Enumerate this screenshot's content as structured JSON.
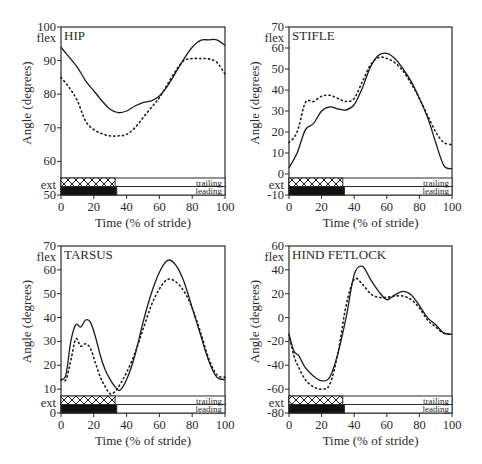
{
  "figure": {
    "xlabel": "Time (% of stride)",
    "ylabel": "Angle (degrees)",
    "flex_label": "flex",
    "ext_label": "ext",
    "bar_labels": {
      "trailing": "trailing",
      "leading": "leading"
    },
    "colors": {
      "line": "#1a1a1a",
      "frame": "#2a2a2a",
      "background": "#ffffff"
    }
  },
  "chart_data": [
    {
      "type": "line",
      "title": "HIP",
      "xlabel": "Time (% of stride)",
      "ylabel": "Angle (degrees)",
      "xlim": [
        0,
        100
      ],
      "ylim": [
        50,
        100
      ],
      "xticks": [
        0,
        20,
        40,
        60,
        80,
        100
      ],
      "yticks": [
        50,
        60,
        70,
        80,
        90,
        100
      ],
      "ytick_labels": [
        "50",
        "60",
        "70",
        "80",
        "90",
        "100"
      ],
      "x": [
        0,
        5,
        10,
        15,
        20,
        25,
        30,
        35,
        40,
        45,
        50,
        55,
        60,
        65,
        70,
        75,
        80,
        85,
        90,
        95,
        100
      ],
      "series": [
        {
          "name": "leading (solid)",
          "style": "solid",
          "values": [
            94,
            91,
            88,
            84,
            81,
            78,
            75.5,
            74.5,
            75,
            76.5,
            77.5,
            78,
            79.5,
            82.5,
            86.5,
            90.5,
            94,
            96,
            96.2,
            96.2,
            94.5
          ]
        },
        {
          "name": "trailing (dotted)",
          "style": "dotted",
          "values": [
            85,
            82,
            78,
            72,
            69.5,
            68.2,
            67.6,
            67.6,
            68,
            70,
            73,
            76,
            79,
            83,
            87,
            90,
            90.6,
            90.6,
            90.5,
            89.5,
            86
          ]
        }
      ],
      "stance_bars": {
        "trailing_end": 33,
        "leading_end": 34
      }
    },
    {
      "type": "line",
      "title": "STIFLE",
      "xlabel": "Time (% of stride)",
      "ylabel": "Angle (degrees)",
      "xlim": [
        0,
        100
      ],
      "ylim": [
        -10,
        70
      ],
      "xticks": [
        0,
        20,
        40,
        60,
        80,
        100
      ],
      "yticks": [
        -10,
        0,
        10,
        20,
        30,
        40,
        50,
        60,
        70
      ],
      "ytick_labels": [
        "-10",
        "0",
        "10",
        "20",
        "30",
        "40",
        "50",
        "60",
        "70"
      ],
      "x": [
        0,
        5,
        10,
        15,
        20,
        25,
        30,
        35,
        40,
        45,
        50,
        55,
        60,
        65,
        70,
        75,
        80,
        85,
        90,
        95,
        100
      ],
      "series": [
        {
          "name": "leading (solid)",
          "style": "solid",
          "values": [
            3,
            10,
            21,
            24,
            30,
            32,
            31,
            30.5,
            33,
            41,
            51,
            56.5,
            57.5,
            55,
            50,
            44,
            36,
            27,
            15,
            4,
            2.5
          ]
        },
        {
          "name": "trailing (dotted)",
          "style": "dotted",
          "values": [
            15,
            20,
            34,
            34.5,
            37,
            37.5,
            36,
            34.5,
            36,
            44,
            52,
            55.5,
            55,
            53,
            49,
            43,
            36,
            28,
            20,
            15,
            14
          ]
        }
      ],
      "stance_bars": {
        "trailing_end": 33,
        "leading_end": 34
      }
    },
    {
      "type": "line",
      "title": "TARSUS",
      "xlabel": "Time (% of stride)",
      "ylabel": "Angle (degrees)",
      "xlim": [
        0,
        100
      ],
      "ylim": [
        0,
        70
      ],
      "xticks": [
        0,
        20,
        40,
        60,
        80,
        100
      ],
      "yticks": [
        0,
        10,
        20,
        30,
        40,
        50,
        60,
        70
      ],
      "ytick_labels": [
        "0",
        "10",
        "20",
        "30",
        "40",
        "50",
        "60",
        "70"
      ],
      "x": [
        0,
        3,
        6,
        9,
        12,
        15,
        18,
        21,
        24,
        27,
        30,
        33,
        36,
        40,
        45,
        50,
        55,
        60,
        65,
        70,
        75,
        80,
        85,
        90,
        95,
        100
      ],
      "series": [
        {
          "name": "leading (solid)",
          "style": "solid",
          "values": [
            14,
            16,
            30,
            37,
            36,
            39,
            38,
            32,
            24,
            18,
            14,
            11,
            9.5,
            14,
            24,
            38,
            50,
            59,
            64,
            62,
            55,
            44,
            33,
            22,
            15,
            14
          ]
        },
        {
          "name": "trailing (dotted)",
          "style": "dotted",
          "values": [
            14,
            14,
            22,
            31,
            28,
            29,
            27,
            21,
            15,
            11,
            8,
            9,
            12,
            17,
            25,
            35,
            45,
            52,
            56,
            55,
            51,
            44,
            34,
            23,
            16,
            15
          ]
        }
      ],
      "stance_bars": {
        "trailing_end": 33,
        "leading_end": 34
      }
    },
    {
      "type": "line",
      "title": "HIND FETLOCK",
      "xlabel": "Time (% of stride)",
      "ylabel": "Angle (degrees)",
      "xlim": [
        0,
        100
      ],
      "ylim": [
        -80,
        60
      ],
      "xticks": [
        0,
        20,
        40,
        60,
        80,
        100
      ],
      "yticks": [
        -80,
        -60,
        -40,
        -20,
        0,
        20,
        40,
        60
      ],
      "ytick_labels": [
        "-80",
        "-60",
        "-40",
        "-20",
        "0",
        "20",
        "40",
        "60"
      ],
      "x": [
        0,
        3,
        6,
        10,
        15,
        20,
        25,
        30,
        35,
        40,
        45,
        50,
        55,
        60,
        65,
        70,
        75,
        80,
        85,
        90,
        95,
        100
      ],
      "series": [
        {
          "name": "leading (solid)",
          "style": "solid",
          "values": [
            -14,
            -28,
            -32,
            -42,
            -49,
            -53,
            -50,
            -30,
            0,
            36,
            43,
            32,
            22,
            15,
            19,
            22,
            19,
            10,
            0,
            -6,
            -13,
            -14
          ]
        },
        {
          "name": "trailing (dotted)",
          "style": "dotted",
          "values": [
            -14,
            -32,
            -42,
            -52,
            -58,
            -60,
            -56,
            -30,
            10,
            32,
            28,
            20,
            17,
            17,
            18,
            18,
            15,
            8,
            -2,
            -8,
            -13,
            -14
          ]
        }
      ],
      "stance_bars": {
        "trailing_end": 33,
        "leading_end": 34
      }
    }
  ]
}
